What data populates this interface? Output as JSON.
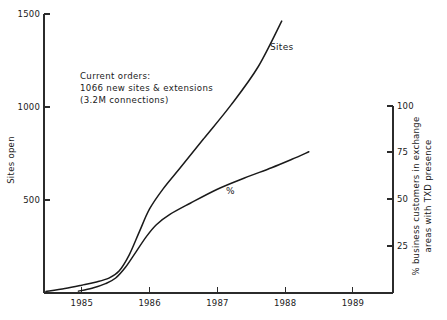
{
  "chart_data": {
    "type": "line",
    "title": "",
    "xlabel": "",
    "ylabel": "Sites open",
    "y2label": "% business customers in exchange areas with TXD presence",
    "grid": false,
    "legend": "inline-labels",
    "xlim": [
      1984.45,
      1989.6
    ],
    "ylim": [
      0,
      1500
    ],
    "y2lim": [
      0,
      107
    ],
    "xticks": [
      "1985",
      "1986",
      "1987",
      "1988",
      "1989"
    ],
    "xtick_values": [
      1985,
      1986,
      1987,
      1988,
      1989
    ],
    "yticks": [
      "500",
      "1000",
      "1500"
    ],
    "ytick_values": [
      500,
      1000,
      1500
    ],
    "y2ticks": [
      "25",
      "50",
      "75",
      "100"
    ],
    "y2tick_values": [
      25,
      50,
      75,
      100
    ],
    "series": [
      {
        "name": "Sites",
        "label": "Sites",
        "axis": "left",
        "x": [
          1984.47,
          1984.75,
          1985.0,
          1985.2,
          1985.4,
          1985.55,
          1985.7,
          1985.85,
          1986.0,
          1986.2,
          1986.45,
          1986.8,
          1987.2,
          1987.6,
          1987.95
        ],
        "values": [
          8,
          24,
          42,
          58,
          80,
          118,
          205,
          330,
          452,
          560,
          672,
          830,
          1010,
          1215,
          1462
        ]
      },
      {
        "name": "%",
        "label": "%",
        "axis": "right",
        "x": [
          1984.95,
          1985.15,
          1985.35,
          1985.5,
          1985.65,
          1985.8,
          1985.95,
          1986.1,
          1986.3,
          1986.6,
          1987.0,
          1987.4,
          1987.8,
          1988.1,
          1988.35
        ],
        "values": [
          1,
          2.5,
          5,
          8,
          14,
          22,
          30,
          36.5,
          42,
          48,
          55.5,
          61.5,
          67,
          71.5,
          75.5
        ]
      }
    ],
    "annotations": [
      {
        "name": "current-orders-note",
        "lines": [
          "Current orders:",
          "1066 new sites & extensions",
          "(3.2M connections)"
        ]
      }
    ]
  },
  "colors": {
    "background": "#ffffff",
    "axis": "#2b2b2b",
    "line": "#1a1a1a",
    "text": "#1a1a1a"
  }
}
